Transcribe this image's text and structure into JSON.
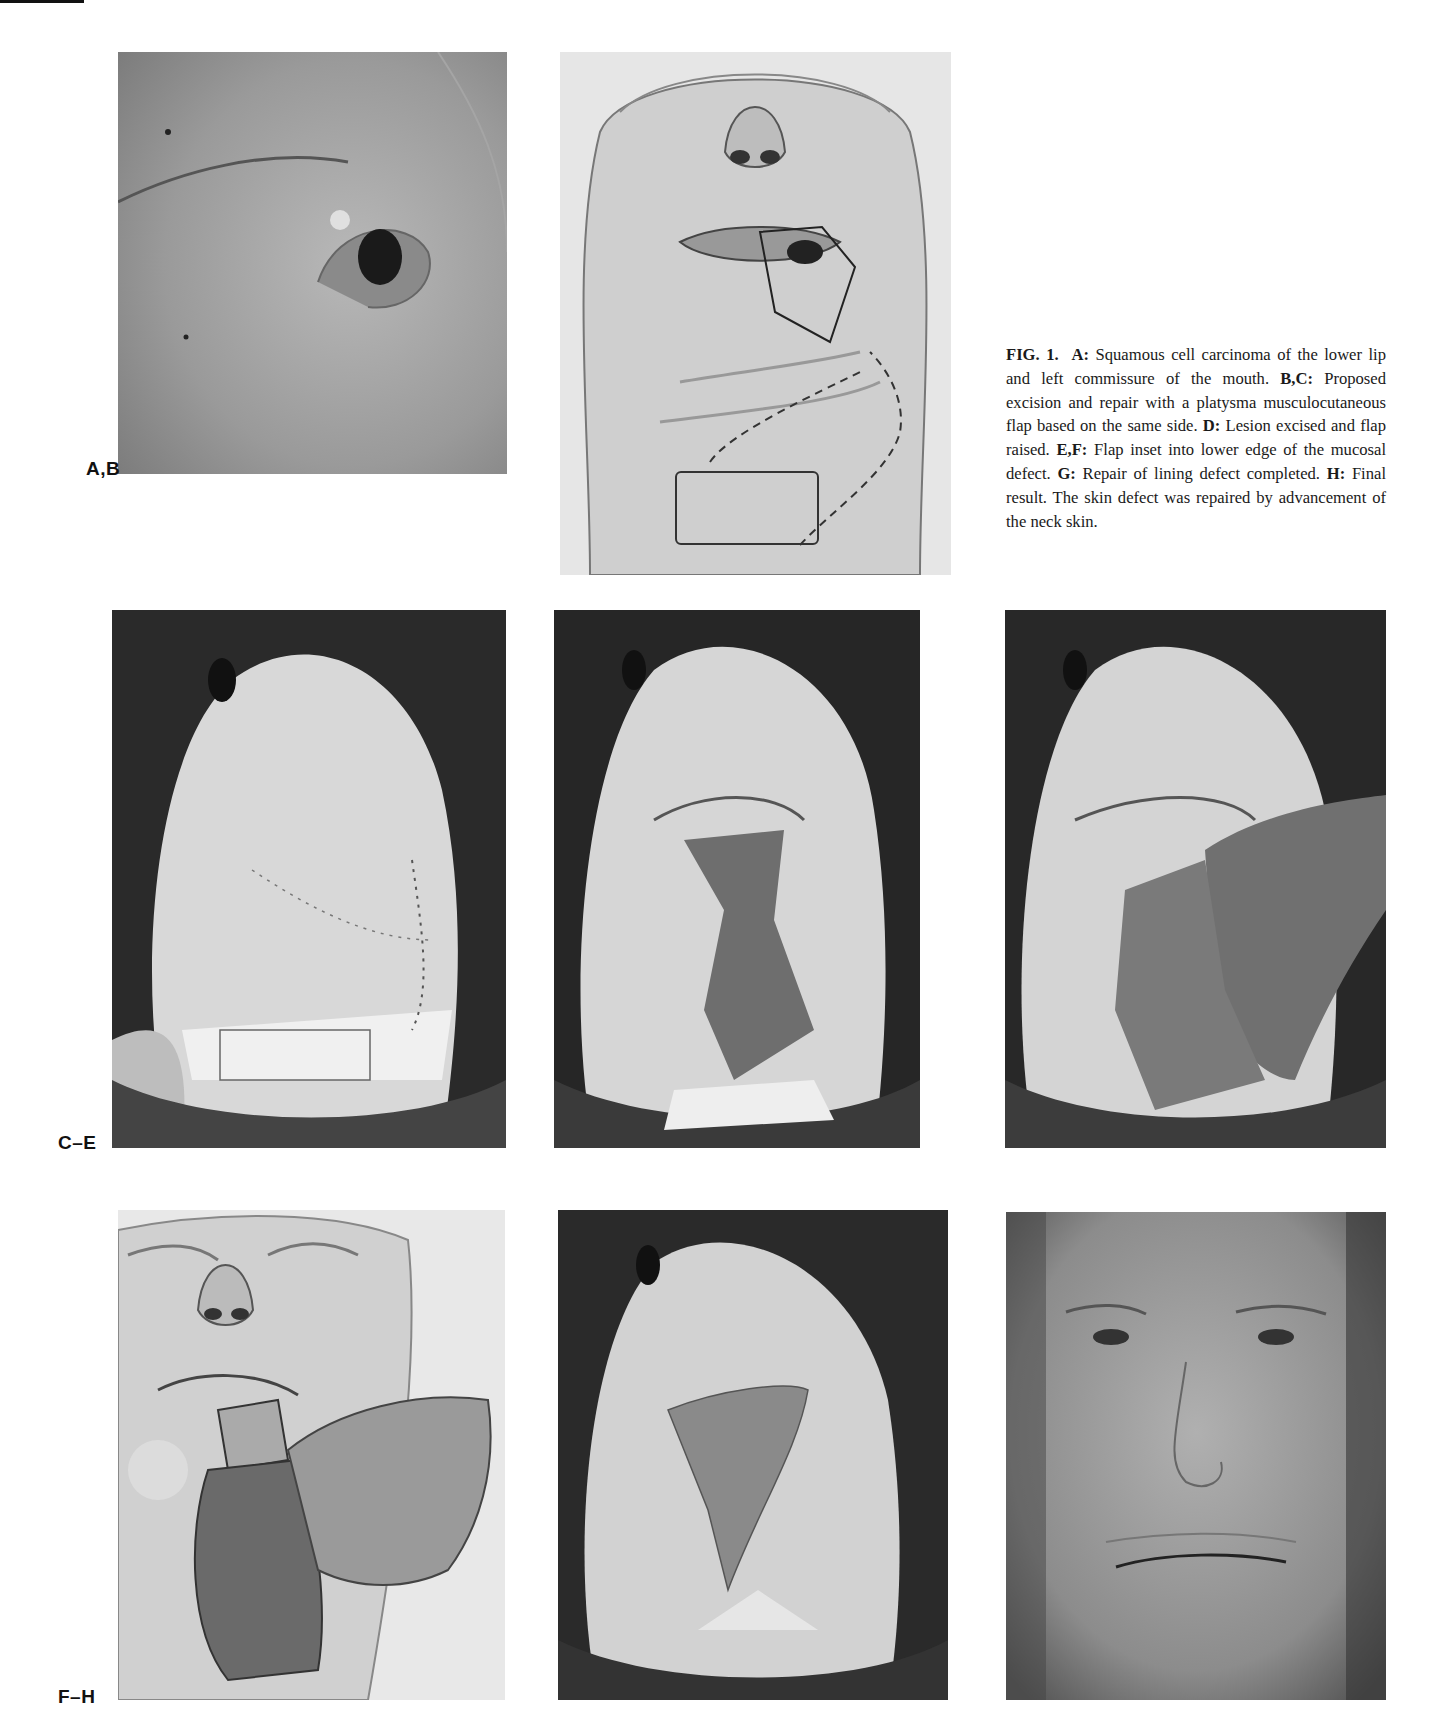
{
  "figure": {
    "number_label": "FIG. 1.",
    "caption_segments": [
      {
        "key": "A:",
        "text": " Squamous cell carcinoma of the lower lip and left commissure of the mouth. "
      },
      {
        "key": "B,C:",
        "text": " Proposed excision and repair with a platysma musculocutaneous flap based on the same side. "
      },
      {
        "key": "D:",
        "text": " Lesion excised and flap raised. "
      },
      {
        "key": "E,F:",
        "text": " Flap inset into lower edge of the mucosal defect. "
      },
      {
        "key": "G:",
        "text": " Repair of lining defect completed. "
      },
      {
        "key": "H:",
        "text": " Final result. The skin defect was repaired by advancement of the neck skin."
      }
    ],
    "row_labels": [
      "A,B",
      "C–E",
      "F–H"
    ],
    "panels": [
      {
        "id": "A",
        "description": "Clinical photograph of lip lesion at left commissure"
      },
      {
        "id": "B",
        "description": "Illustration of proposed excision and platysma flap design"
      },
      {
        "id": "C",
        "description": "Intraoperative photograph with markings"
      },
      {
        "id": "D",
        "description": "Intraoperative photograph: lesion excised and flap raised"
      },
      {
        "id": "E",
        "description": "Intraoperative photograph: flap inset"
      },
      {
        "id": "F",
        "description": "Illustration of flap inset into mucosal defect"
      },
      {
        "id": "G",
        "description": "Intraoperative photograph: lining defect repaired"
      },
      {
        "id": "H",
        "description": "Postoperative photograph: final result"
      }
    ]
  }
}
